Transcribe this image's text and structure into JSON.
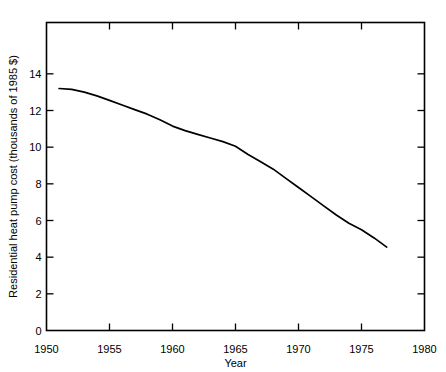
{
  "chart_data": {
    "type": "line",
    "title": "",
    "xlabel": "Year",
    "ylabel": "Residential heat pump cost (thousands of 1985 $)",
    "xlim": [
      1950,
      1980
    ],
    "ylim": [
      0,
      16.8
    ],
    "grid": false,
    "legend": null,
    "xticks": [
      1950,
      1955,
      1960,
      1965,
      1970,
      1975,
      1980
    ],
    "xtick_labels": [
      "1950",
      "1955",
      "1960",
      "1965",
      "1970",
      "1975",
      "1980"
    ],
    "yticks": [
      0,
      2,
      4,
      6,
      8,
      10,
      12,
      14
    ],
    "ytick_labels": [
      "0",
      "2",
      "4",
      "6",
      "8",
      "10",
      "12",
      "14"
    ],
    "series": [
      {
        "name": "Residential heat pump cost",
        "color": "#000000",
        "x": [
          1951,
          1952,
          1953,
          1954,
          1955,
          1956,
          1957,
          1958,
          1959,
          1960,
          1961,
          1962,
          1963,
          1964,
          1965,
          1966,
          1967,
          1968,
          1969,
          1970,
          1971,
          1972,
          1973,
          1974,
          1975,
          1976,
          1977
        ],
        "values": [
          13.2,
          13.15,
          13.0,
          12.8,
          12.55,
          12.3,
          12.05,
          11.8,
          11.5,
          11.15,
          10.9,
          10.7,
          10.5,
          10.3,
          10.05,
          9.6,
          9.2,
          8.8,
          8.3,
          7.8,
          7.3,
          6.8,
          6.3,
          5.85,
          5.5,
          5.05,
          4.55
        ]
      }
    ]
  },
  "axes": {
    "x_axis_title": "Year",
    "y_axis_title": "Residential heat pump cost (thousands of 1985 $)"
  }
}
